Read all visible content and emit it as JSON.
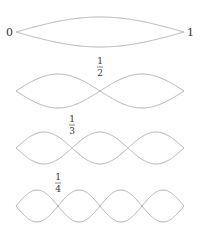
{
  "diagram": {
    "stroke_color": "#b4b4b4",
    "text_color": "#333333",
    "string": {
      "x_start": 16,
      "x_end": 184
    },
    "endpoint_labels": {
      "left": "0",
      "right": "1"
    },
    "modes": [
      {
        "harmonic": 1,
        "center_y": 32,
        "amplitude": 15,
        "node_label": null
      },
      {
        "harmonic": 2,
        "center_y": 91,
        "amplitude": 17,
        "node_label": {
          "num": "1",
          "den": "2",
          "x": 100
        }
      },
      {
        "harmonic": 3,
        "center_y": 148,
        "amplitude": 16,
        "node_label": {
          "num": "1",
          "den": "3",
          "x": 72
        }
      },
      {
        "harmonic": 4,
        "center_y": 206,
        "amplitude": 16,
        "node_label": {
          "num": "1",
          "den": "4",
          "x": 58
        }
      }
    ]
  }
}
